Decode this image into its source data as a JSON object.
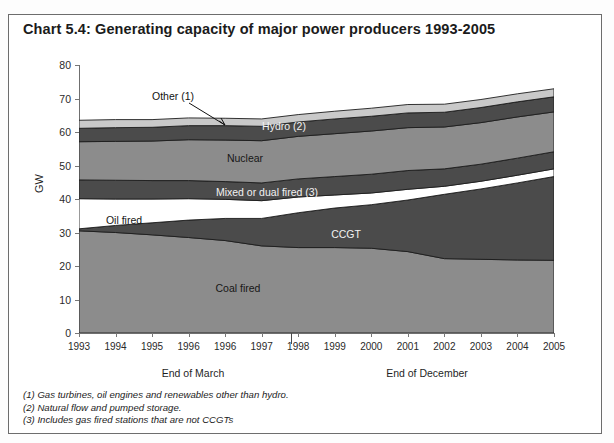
{
  "title": "Chart 5.4: Generating capacity of major power producers 1993-2005",
  "axis": {
    "ylabel": "GW",
    "yticks": [
      "0",
      "10",
      "20",
      "30",
      "40",
      "50",
      "60",
      "70",
      "80"
    ],
    "xticks": [
      "1993",
      "1994",
      "1995",
      "1996",
      "1996",
      "1997",
      "1998",
      "1999",
      "2000",
      "2001",
      "2002",
      "2003",
      "2004",
      "2005"
    ],
    "period_march": "End of March",
    "period_december": "End of December"
  },
  "band_labels": {
    "other": "Other (1)",
    "hydro": "Hydro (2)",
    "nuclear": "Nuclear",
    "mixed": "Mixed or dual fired (3)",
    "oil": "Oil fired",
    "ccgt": "CCGT",
    "coal": "Coal fired"
  },
  "footnotes": [
    "(1) Gas turbines, oil engines and renewables other than hydro.",
    "(2) Natural flow and pumped storage.",
    "(3) Includes gas fired stations that are not CCGTs"
  ],
  "colors": {
    "coal": "#8c8c8c",
    "ccgt": "#4b4b4b",
    "oil": "#ffffff",
    "mixed": "#4b4b4b",
    "nuclear": "#8c8c8c",
    "hydro": "#4b4b4b",
    "other": "#c9c9c9",
    "outline": "#1d1d1d",
    "axis": "#6f6f6f",
    "text": "#1b1b1b"
  },
  "chart_data": {
    "type": "area",
    "title": "Chart 5.4: Generating capacity of major power producers 1993-2005",
    "xlabel": "",
    "ylabel": "GW",
    "ylim": [
      0,
      80
    ],
    "grid": false,
    "legend": "in-plot labels",
    "stacked": true,
    "x": [
      "1993",
      "1994",
      "1995",
      "1996",
      "1996",
      "1997",
      "1998",
      "1999",
      "2000",
      "2001",
      "2002",
      "2003",
      "2004",
      "2005"
    ],
    "series": [
      {
        "name": "Coal fired",
        "values": [
          30.5,
          30.0,
          29.3,
          28.5,
          27.6,
          26.0,
          25.5,
          25.5,
          25.3,
          24.3,
          22.2,
          22.0,
          21.8,
          21.7
        ]
      },
      {
        "name": "CCGT",
        "values": [
          0.6,
          2.1,
          3.6,
          5.2,
          6.6,
          8.2,
          10.4,
          11.8,
          13.0,
          15.4,
          19.2,
          21.0,
          23.0,
          25.0
        ]
      },
      {
        "name": "Oil fired",
        "values": [
          9.0,
          7.9,
          7.1,
          6.4,
          5.7,
          5.3,
          4.7,
          3.9,
          3.5,
          3.2,
          2.4,
          2.3,
          2.3,
          2.3
        ]
      },
      {
        "name": "Mixed or dual fired (3)",
        "values": [
          5.6,
          5.6,
          5.5,
          5.4,
          5.3,
          5.3,
          5.4,
          5.5,
          5.6,
          5.6,
          5.2,
          5.1,
          5.1,
          5.1
        ]
      },
      {
        "name": "Nuclear",
        "values": [
          11.4,
          11.6,
          11.8,
          12.2,
          12.4,
          12.6,
          12.7,
          12.8,
          12.9,
          12.8,
          12.5,
          12.4,
          12.3,
          11.9
        ]
      },
      {
        "name": "Hydro (2)",
        "values": [
          4.0,
          4.1,
          4.1,
          4.2,
          4.3,
          4.3,
          4.3,
          4.4,
          4.4,
          4.4,
          4.4,
          4.5,
          4.5,
          4.5
        ]
      },
      {
        "name": "Other (1)",
        "values": [
          2.4,
          2.4,
          2.3,
          2.3,
          2.2,
          2.2,
          2.2,
          2.3,
          2.4,
          2.5,
          2.4,
          2.4,
          2.4,
          2.4
        ]
      }
    ],
    "totals": [
      63.5,
      63.7,
      63.7,
      64.2,
      64.1,
      63.9,
      65.2,
      66.2,
      67.1,
      68.2,
      68.3,
      69.7,
      71.4,
      72.9
    ],
    "annotations": [
      {
        "text": "Other (1)",
        "x": "1995",
        "note": "leader line pointing to top thin band near 1996"
      }
    ]
  }
}
